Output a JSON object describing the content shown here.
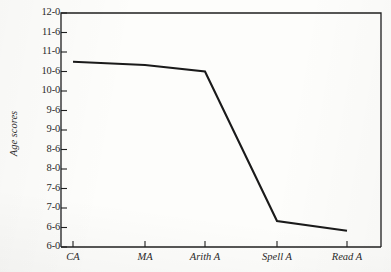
{
  "chart_data": {
    "type": "line",
    "title": "",
    "xlabel": "",
    "ylabel": "Age scores",
    "categories": [
      "CA",
      "MA",
      "Arith A",
      "Spell A",
      "Read A"
    ],
    "values": [
      "10-9",
      "10-8",
      "10-6",
      "6-8",
      "6-5"
    ],
    "values_numeric": [
      10.75,
      10.667,
      10.5,
      6.667,
      6.417
    ],
    "y_tick_labels": [
      "12-0",
      "11-6",
      "11-0",
      "10-6",
      "10-0",
      "9-6",
      "9-0",
      "8-6",
      "8-0",
      "7-6",
      "7-0",
      "6-6",
      "6-0"
    ],
    "y_tick_values": [
      12.0,
      11.5,
      11.0,
      10.5,
      10.0,
      9.5,
      9.0,
      8.5,
      8.0,
      7.5,
      7.0,
      6.5,
      6.0
    ],
    "ylim": [
      6.0,
      12.0
    ],
    "units_note": "years-months",
    "grid": false,
    "legend": "none",
    "line_color": "#1a1a1a",
    "series": [
      {
        "name": "Age scores",
        "values": [
          "10-9",
          "10-8",
          "10-6",
          "6-8",
          "6-5"
        ]
      }
    ]
  }
}
